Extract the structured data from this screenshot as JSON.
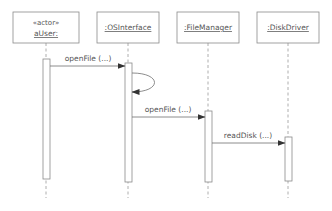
{
  "diagram": {
    "type": "UML sequence diagram",
    "participants": [
      {
        "id": "aUser",
        "stereotype": "«actor»",
        "name": "aUser:"
      },
      {
        "id": "os",
        "stereotype": "",
        "name": ":OSInterface"
      },
      {
        "id": "fm",
        "stereotype": "",
        "name": ":FileManager"
      },
      {
        "id": "dd",
        "stereotype": "",
        "name": ":DiskDriver"
      }
    ],
    "messages": [
      {
        "from": "aUser",
        "to": "os",
        "label": "openFile (...)"
      },
      {
        "from": "os",
        "to": "os",
        "label": ""
      },
      {
        "from": "os",
        "to": "fm",
        "label": "openFile (...)"
      },
      {
        "from": "fm",
        "to": "dd",
        "label": "readDisk (...)"
      }
    ],
    "colors": {
      "line": "#8a8a8a",
      "text": "#555555",
      "background": "#ffffff"
    }
  }
}
